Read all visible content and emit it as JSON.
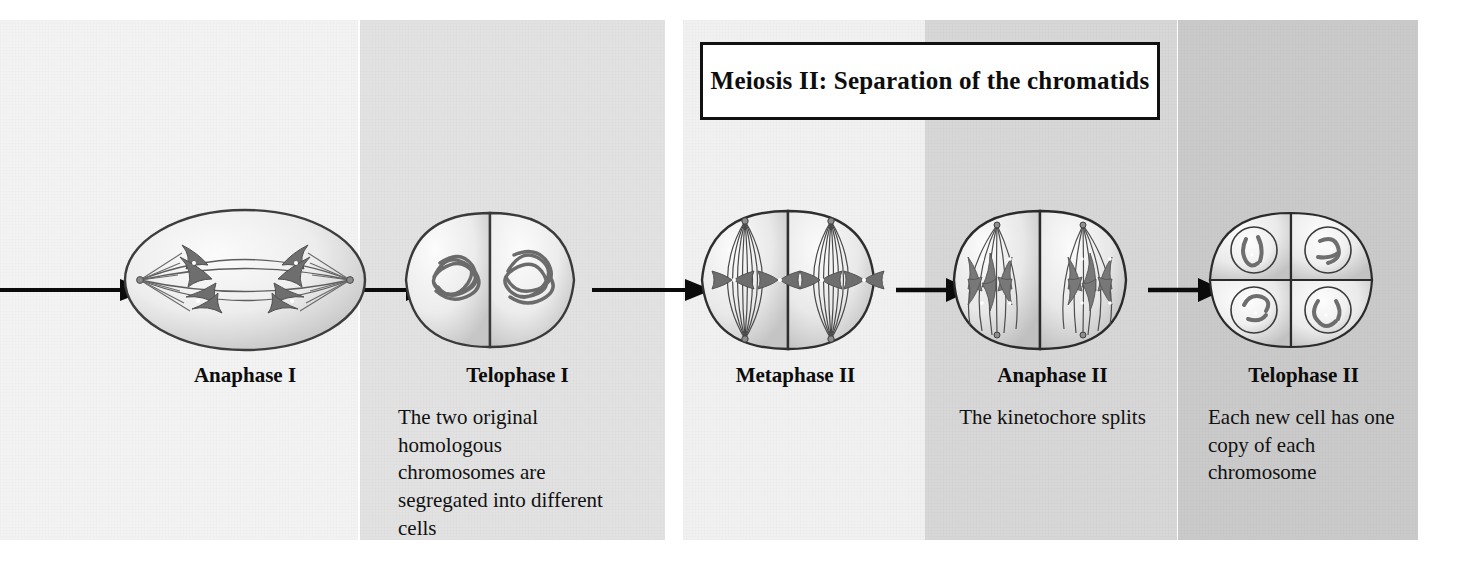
{
  "figure": {
    "title_banner": "Meiosis II: Separation of the chromatids",
    "colors": {
      "panel_anaphase1": "#f3f3f3",
      "panel_telophase1": "#e2e2e2",
      "panel_metaphase2": "#f1f1f1",
      "panel_anaphase2": "#d7d7d7",
      "panel_telophase2": "#cacaca",
      "ink": "#111111",
      "chromosome": "#6e6e6e",
      "cell_fill": "#e9e9e9"
    }
  },
  "stages": [
    {
      "id": "anaphase1",
      "label": "Anaphase I",
      "caption": ""
    },
    {
      "id": "telophase1",
      "label": "Telophase I",
      "caption": "The two original homologous chromosomes are segregated into different cells"
    },
    {
      "id": "metaphase2",
      "label": "Metaphase II",
      "caption": ""
    },
    {
      "id": "anaphase2",
      "label": "Anaphase II",
      "caption": "The kinetochore splits"
    },
    {
      "id": "telophase2",
      "label": "Telophase II",
      "caption": "Each new cell has one copy of each chromosome"
    }
  ]
}
